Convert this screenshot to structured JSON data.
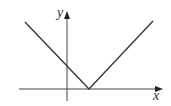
{
  "diagram": {
    "type": "function-graph",
    "axes": {
      "x_label": "x",
      "y_label": "y",
      "origin_px": [
        67,
        89
      ]
    },
    "curve": {
      "shape": "V",
      "points_px": [
        [
          25,
          22
        ],
        [
          89,
          89
        ],
        [
          153,
          21
        ]
      ],
      "vertex_px": [
        89,
        89
      ],
      "y_intercept_px": [
        67,
        66
      ]
    },
    "colors": {
      "line": "#333333",
      "axis": "#444444",
      "background": "#ffffff"
    }
  }
}
